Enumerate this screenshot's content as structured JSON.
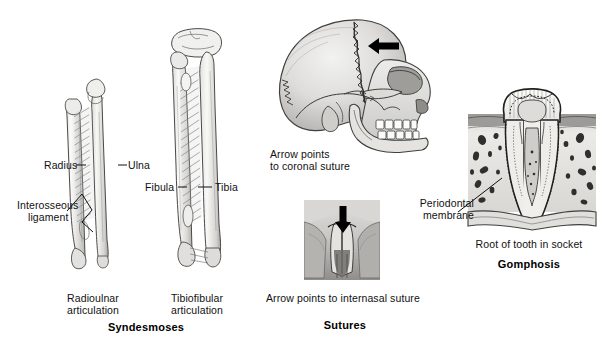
{
  "figure": {
    "background_color": "#ffffff",
    "ink_color": "#111111"
  },
  "panels": [
    {
      "id": "syndesmoses",
      "caption_bold": "Syndesmoses",
      "sub_captions": [
        {
          "line1": "Radioulnar",
          "line2": "articulation"
        },
        {
          "line1": "Tibiofibular",
          "line2": "articulation"
        }
      ],
      "labels": [
        {
          "name": "radius",
          "text": "Radius"
        },
        {
          "name": "ulna",
          "text": "Ulna"
        },
        {
          "name": "interosseous-ligament",
          "line1": "Interosseous",
          "line2": "ligament"
        },
        {
          "name": "fibula",
          "text": "Fibula"
        },
        {
          "name": "tibia",
          "text": "Tibia"
        }
      ]
    },
    {
      "id": "sutures",
      "caption_bold": "Sutures",
      "skull_note": {
        "line1": "Arrow points",
        "line2": "to coronal suture"
      },
      "nasal_note": "Arrow points to internasal suture",
      "arrows": [
        {
          "name": "coronal-suture-arrow",
          "direction": "left"
        },
        {
          "name": "internasal-suture-arrow",
          "direction": "down"
        }
      ]
    },
    {
      "id": "gomphosis",
      "caption_bold": "Gomphosis",
      "sub_caption": "Root of tooth in socket",
      "labels": [
        {
          "name": "periodontal-membrane",
          "line1": "Periodontal",
          "line2": "membrane"
        }
      ]
    }
  ]
}
